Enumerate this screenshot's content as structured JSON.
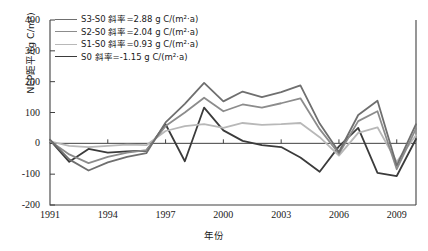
{
  "chart_data": {
    "type": "line",
    "title": "",
    "xlabel": "年份",
    "ylabel": "NEP距平/(g C/m²)",
    "xlim": [
      1991,
      2010
    ],
    "ylim": [
      -200,
      400
    ],
    "yticks": [
      400,
      300,
      200,
      100,
      0,
      -100,
      -200
    ],
    "ytick_labels": [
      "400",
      "300",
      "200",
      "100",
      "0",
      "-100",
      "-200"
    ],
    "xticks": [
      1991,
      1994,
      1997,
      2000,
      2003,
      2006,
      2009
    ],
    "xtick_labels": [
      "1991",
      "1994",
      "1997",
      "2000",
      "2003",
      "2006",
      "2009"
    ],
    "grid": false,
    "legend_position": "upper-left",
    "x": [
      1991,
      1992,
      1993,
      1994,
      1995,
      1996,
      1997,
      1998,
      1999,
      2000,
      2001,
      2002,
      2003,
      2004,
      2005,
      2006,
      2007,
      2008,
      2009,
      2010
    ],
    "series": [
      {
        "name": "S3-S0",
        "legend_label": "S3-S0 斜率=2.88 g C/(m²·a)",
        "slope": 2.88,
        "slope_units": "g C/(m²·a)",
        "color": "#6f6f6f",
        "width": 1.8,
        "values": [
          12,
          -52,
          -88,
          -62,
          -44,
          -32,
          68,
          128,
          196,
          136,
          168,
          150,
          166,
          188,
          64,
          -28,
          92,
          138,
          -72,
          62
        ]
      },
      {
        "name": "S2-S0",
        "legend_label": "S2-S0 斜率=2.04 g C/(m²·a)",
        "slope": 2.04,
        "slope_units": "g C/(m²·a)",
        "color": "#8c8c8c",
        "width": 1.8,
        "values": [
          8,
          -36,
          -64,
          -44,
          -30,
          -22,
          56,
          100,
          148,
          104,
          126,
          116,
          130,
          146,
          46,
          -34,
          72,
          104,
          -84,
          48
        ]
      },
      {
        "name": "S1-S0",
        "legend_label": "S1-S0 斜率=0.93 g C/(m²·a)",
        "slope": 0.93,
        "slope_units": "g C/(m²·a)",
        "color": "#b8b8b8",
        "width": 1.8,
        "values": [
          6,
          -8,
          -12,
          -8,
          -4,
          -6,
          40,
          56,
          62,
          50,
          66,
          60,
          62,
          66,
          20,
          -40,
          34,
          52,
          -60,
          26
        ]
      },
      {
        "name": "S0",
        "legend_label": "S0  斜率=-1.15 g C/(m²·a)",
        "slope": -1.15,
        "slope_units": "g C/(m²·a)",
        "color": "#3b3b3b",
        "width": 1.8,
        "values": [
          10,
          -60,
          -18,
          -30,
          -26,
          -24,
          62,
          -58,
          116,
          42,
          8,
          -6,
          -12,
          -46,
          -92,
          -10,
          50,
          -96,
          -106,
          14
        ]
      }
    ]
  }
}
